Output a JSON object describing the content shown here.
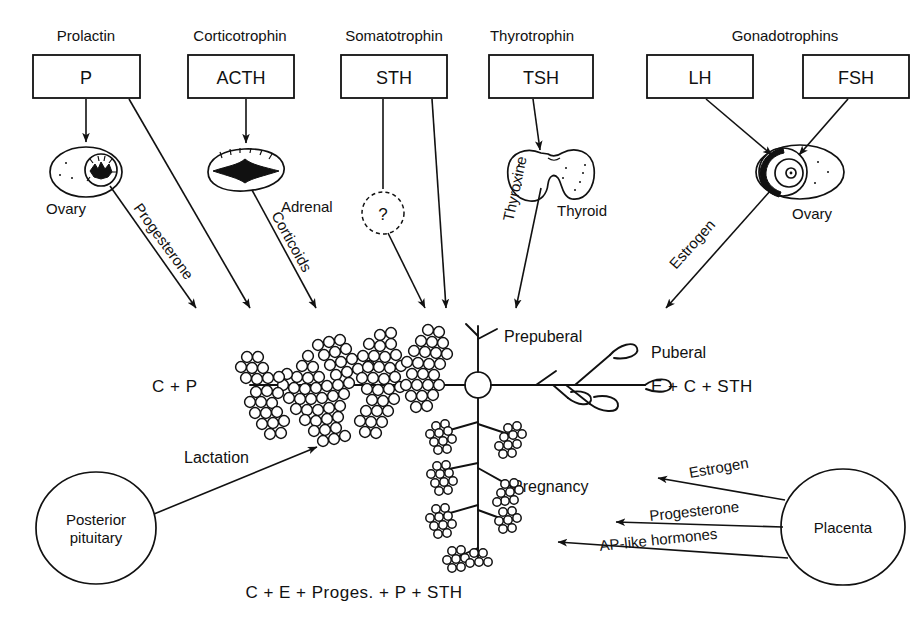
{
  "diagram": {
    "hormone_boxes": [
      {
        "caption": "Prolactin",
        "label": "P",
        "name": "prolactin"
      },
      {
        "caption": "Corticotrophin",
        "label": "ACTH",
        "name": "corticotrophin"
      },
      {
        "caption": "Somatotrophin",
        "label": "STH",
        "name": "somatotrophin"
      },
      {
        "caption": "Thyrotrophin",
        "label": "TSH",
        "name": "thyrotrophin"
      },
      {
        "caption": "Gonadotrophins",
        "label": "LH",
        "name": "lh"
      },
      {
        "caption": "Gonadotrophins",
        "label": "FSH",
        "name": "fsh"
      }
    ],
    "gonadotrophins_caption": "Gonadotrophins",
    "organs": [
      {
        "label": "Ovary",
        "name": "ovary-left"
      },
      {
        "label": "Adrenal",
        "name": "adrenal"
      },
      {
        "label": "?",
        "name": "unknown-mediator"
      },
      {
        "label": "Thyroid",
        "name": "thyroid"
      },
      {
        "label": "Ovary",
        "name": "ovary-right"
      }
    ],
    "hormone_arrow_labels": [
      {
        "label": "Progesterone",
        "name": "progesterone-left"
      },
      {
        "label": "Corticoids",
        "name": "corticoids"
      },
      {
        "label": "Thyroxine",
        "name": "thyroxine"
      },
      {
        "label": "Estrogen",
        "name": "estrogen-ovary"
      }
    ],
    "gland": {
      "stages": [
        {
          "label": "Prepuberal",
          "name": "prepuberal"
        },
        {
          "label": "Puberal",
          "name": "puberal"
        },
        {
          "label": "Pregnancy",
          "name": "pregnancy"
        }
      ],
      "formulas": [
        {
          "label": "C + P",
          "name": "lactation-formula"
        },
        {
          "label": "E + C + STH",
          "name": "puberal-formula"
        },
        {
          "label": "C + E + Proges. + P + STH",
          "name": "pregnancy-formula"
        }
      ],
      "lactation_label": "Lactation"
    },
    "sources": [
      {
        "label": "Posterior\npituitary",
        "line1": "Posterior",
        "line2": "pituitary",
        "name": "posterior-pituitary"
      },
      {
        "label": "Placenta",
        "name": "placenta"
      }
    ],
    "placenta_arrows": [
      {
        "label": "Estrogen",
        "name": "placenta-estrogen"
      },
      {
        "label": "Progesterone",
        "name": "placenta-progesterone"
      },
      {
        "label": "AP-like hormones",
        "name": "placenta-ap-like-hormones"
      }
    ],
    "colors": {
      "ink": "#111111",
      "paper": "#ffffff"
    }
  }
}
